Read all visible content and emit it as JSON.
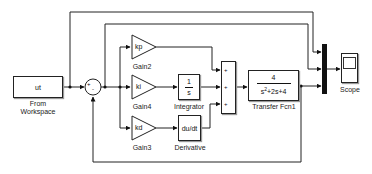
{
  "diagram": {
    "blocks": {
      "from_workspace": {
        "value": "ut",
        "label_line1": "From",
        "label_line2": "Workspace"
      },
      "sum1": {
        "sign_left": "+",
        "sign_bottom": "-"
      },
      "gain2": {
        "value": "kp",
        "label": "Gain2"
      },
      "gain4": {
        "value": "ki",
        "label": "Gain4"
      },
      "gain3": {
        "value": "kd",
        "label": "Gain3"
      },
      "integrator": {
        "numerator": "1",
        "denominator": "s",
        "label": "Integrator"
      },
      "derivative": {
        "value": "du/dt",
        "label": "Derivative"
      },
      "sum2": {
        "signs": [
          "+",
          "+",
          "+"
        ]
      },
      "transfer_fcn": {
        "numerator": "4",
        "denominator_pre": "s",
        "denominator_exp": "2",
        "denominator_post": "+2s+4",
        "label": "Transfer Fcn1"
      },
      "scope": {
        "label": "Scope"
      }
    },
    "colors": {
      "line": "#222222",
      "block_border": "#222222",
      "mux": "#111111",
      "background": "#ffffff"
    }
  }
}
